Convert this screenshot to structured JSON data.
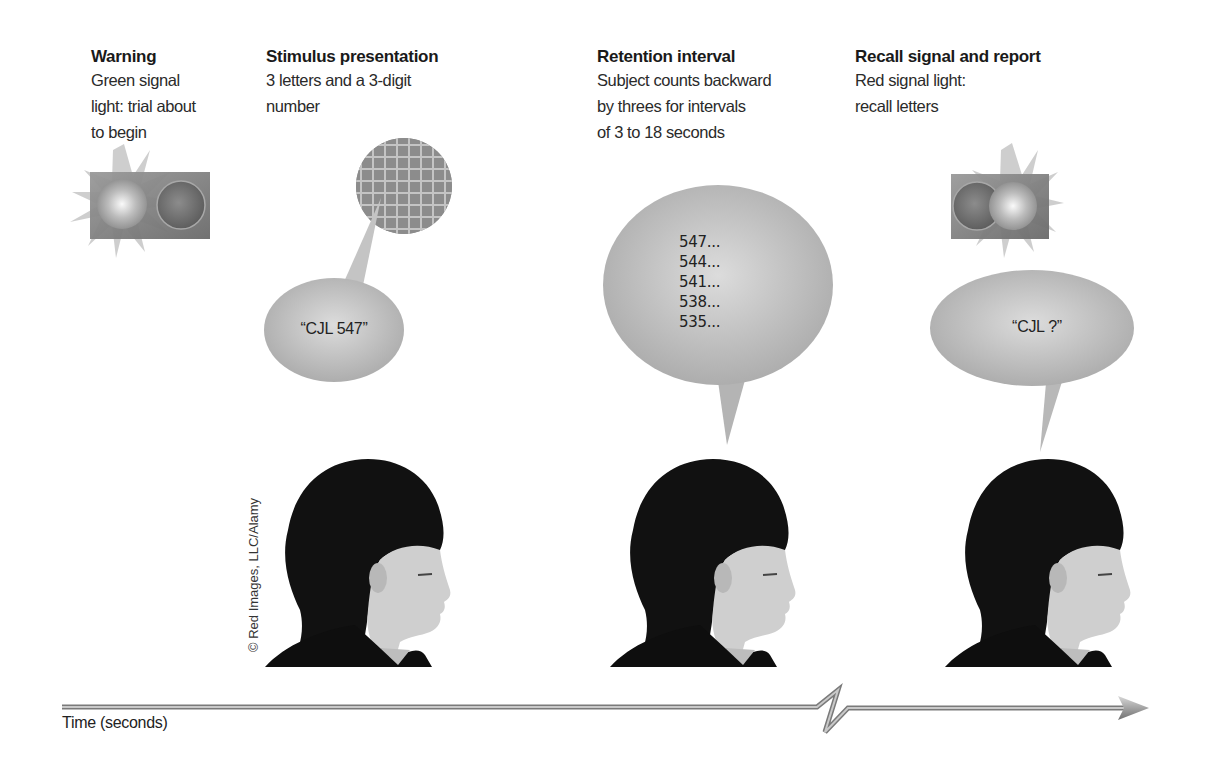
{
  "steps": [
    {
      "title": "Warning",
      "lines": [
        "Green signal",
        "light: trial about",
        "to begin"
      ]
    },
    {
      "title": "Stimulus presentation",
      "lines": [
        "3 letters and a 3-digit",
        "number"
      ]
    },
    {
      "title": "Retention interval",
      "lines": [
        "Subject counts backward",
        "by threes for intervals",
        "of 3 to 18 seconds"
      ]
    },
    {
      "title": "Recall signal and report",
      "lines": [
        "Red signal light:",
        "recall letters"
      ]
    }
  ],
  "bubbles": {
    "stimulus": "“CJL 547”",
    "counting": [
      "547...",
      "544...",
      "541...",
      "538...",
      "535..."
    ],
    "recall": "“CJL ?”"
  },
  "credit": "© Red Images, LLC/Alamy",
  "axis": {
    "label": "Time (seconds)"
  },
  "colors": {
    "bubble": "#b8b8b8",
    "light_box": "#777777",
    "axis": "#8a8a8a"
  }
}
